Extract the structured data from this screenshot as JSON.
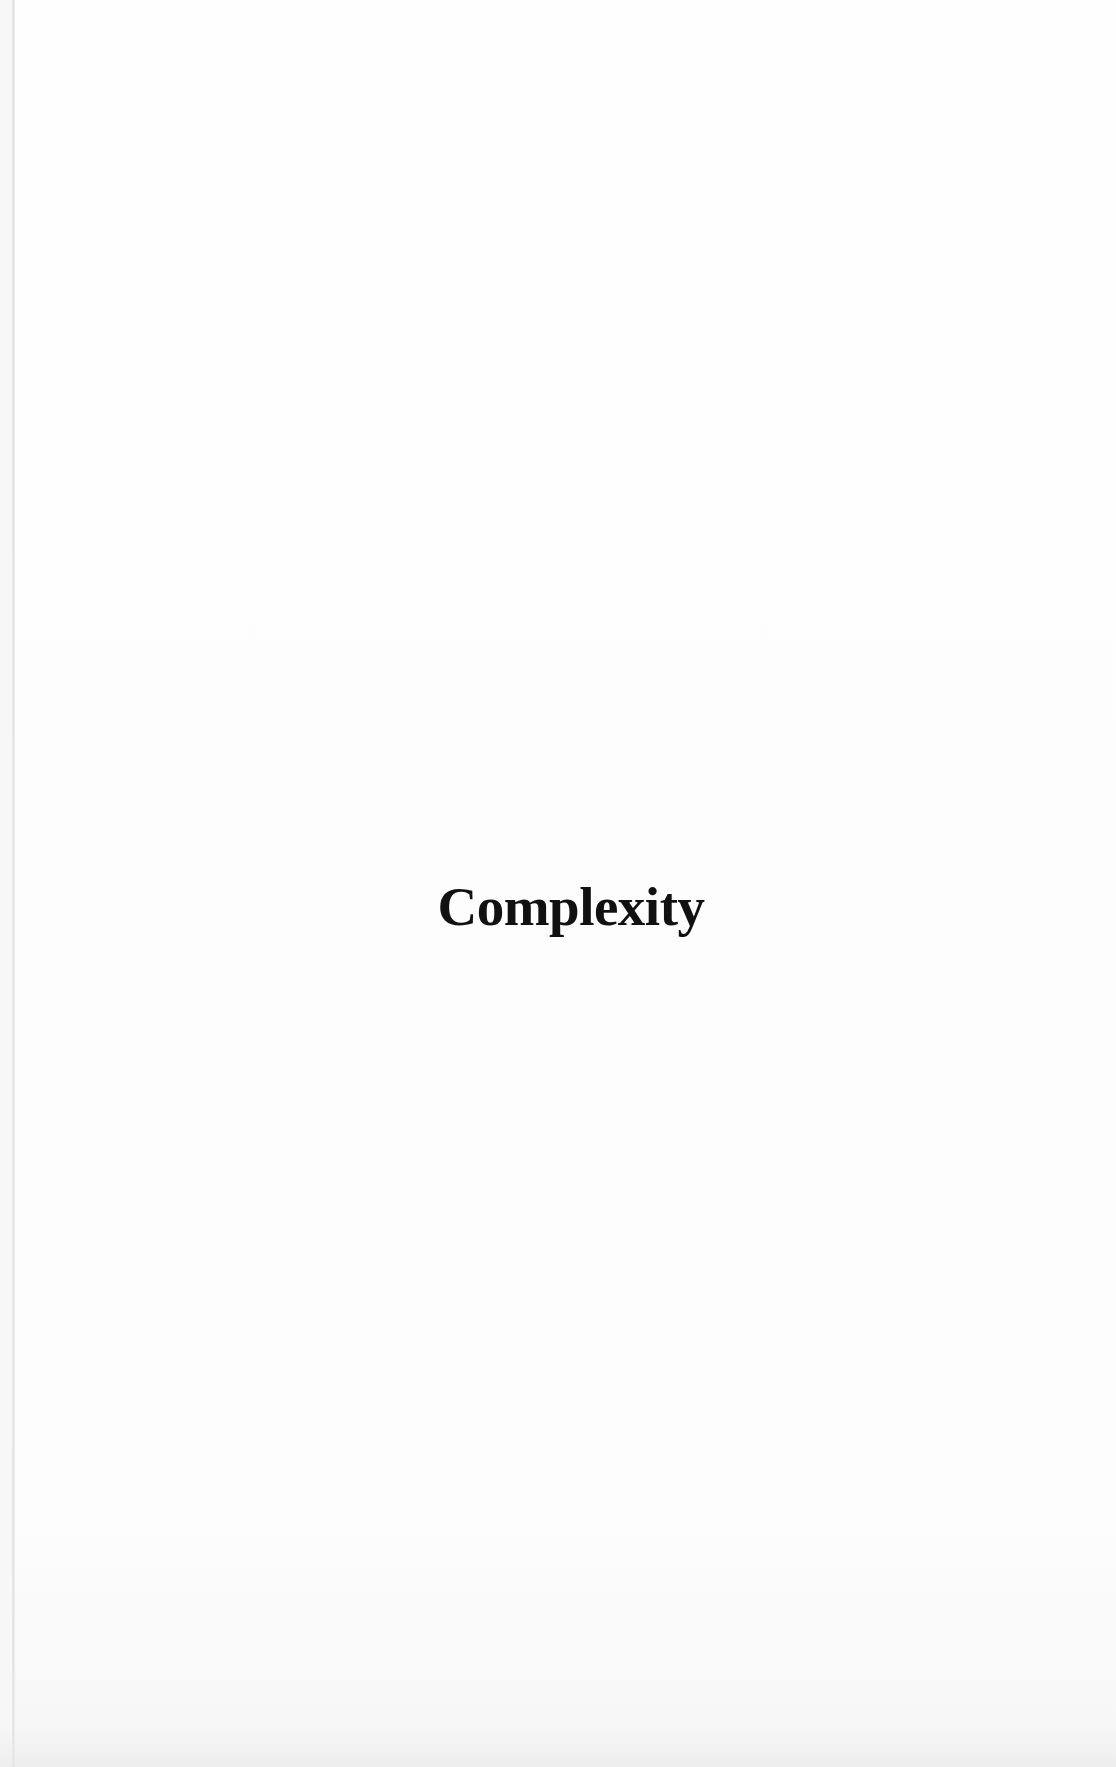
{
  "page": {
    "type": "scanned-book-page",
    "chapter_title": "Complexity"
  },
  "colors": {
    "background": "#fdfdfd",
    "text": "#111111",
    "gutter_line": "#e2e2e2"
  }
}
